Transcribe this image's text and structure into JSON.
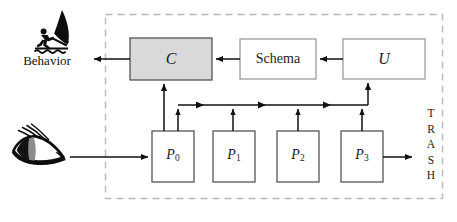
{
  "figure": {
    "type": "block-flow-diagram",
    "background_color": "#ffffff",
    "boundary": {
      "style": "dashed",
      "color": "#b9b9b9",
      "x": 105,
      "y": 14,
      "width": 338,
      "height": 185
    }
  },
  "icons": {
    "windsurfer": "windsurfer-icon",
    "eye": "eye-icon"
  },
  "labels": {
    "behavior": "Behavior",
    "trash_letters": [
      "T",
      "R",
      "A",
      "S",
      "H"
    ],
    "trash_word": "TRASH"
  },
  "nodes": [
    {
      "id": "C",
      "label": "C",
      "italic": true,
      "fill": "#d9d9d9",
      "stroke": "#555555",
      "x": 130,
      "y": 38,
      "w": 82,
      "h": 42
    },
    {
      "id": "Schema",
      "label": "Schema",
      "italic": false,
      "fill": "#ffffff",
      "stroke": "#8a8a8a",
      "x": 240,
      "y": 39,
      "w": 76,
      "h": 40
    },
    {
      "id": "U",
      "label": "U",
      "italic": true,
      "fill": "#ffffff",
      "stroke": "#8a8a8a",
      "x": 343,
      "y": 39,
      "w": 82,
      "h": 40
    },
    {
      "id": "P0",
      "label": "P",
      "sub": "0",
      "italic": true,
      "fill": "#ffffff",
      "stroke": "#555555",
      "x": 152,
      "y": 131,
      "w": 42,
      "h": 51
    },
    {
      "id": "P1",
      "label": "P",
      "sub": "1",
      "italic": true,
      "fill": "#ffffff",
      "stroke": "#555555",
      "x": 213,
      "y": 131,
      "w": 42,
      "h": 51
    },
    {
      "id": "P2",
      "label": "P",
      "sub": "2",
      "italic": true,
      "fill": "#ffffff",
      "stroke": "#555555",
      "x": 277,
      "y": 131,
      "w": 42,
      "h": 51
    },
    {
      "id": "P3",
      "label": "P",
      "sub": "3",
      "italic": true,
      "fill": "#ffffff",
      "stroke": "#555555",
      "x": 341,
      "y": 131,
      "w": 42,
      "h": 51
    }
  ],
  "edges": [
    {
      "from": "C",
      "to": "Behavior",
      "direction": "left"
    },
    {
      "from": "Schema",
      "to": "C",
      "direction": "left"
    },
    {
      "from": "U",
      "to": "Schema",
      "direction": "left"
    },
    {
      "from": "Eye",
      "to": "P0",
      "direction": "right"
    },
    {
      "from": "P0",
      "to": "C",
      "direction": "up"
    },
    {
      "from": "P0",
      "to": "bus",
      "direction": "up"
    },
    {
      "from": "P1",
      "to": "bus",
      "direction": "up"
    },
    {
      "from": "P2",
      "to": "bus",
      "direction": "up"
    },
    {
      "from": "P3",
      "to": "bus",
      "direction": "up"
    },
    {
      "from": "bus",
      "to": "U",
      "direction": "up"
    },
    {
      "from": "P3",
      "to": "TRASH",
      "direction": "right"
    }
  ],
  "bus": {
    "y": 105,
    "x_start": 178,
    "x_end": 368,
    "flow_arrows_x": [
      203,
      265,
      330
    ]
  }
}
